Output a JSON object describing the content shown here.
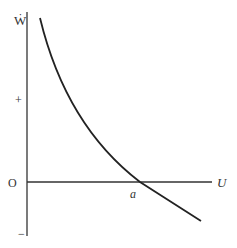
{
  "diagram": {
    "y_axis_label": "Ẇ",
    "x_axis_label": "U",
    "origin_label": "O",
    "plus_label": "+",
    "minus_label": "−",
    "intercept_label": "a",
    "colors": {
      "axis": "#333333",
      "curve": "#222222"
    }
  }
}
